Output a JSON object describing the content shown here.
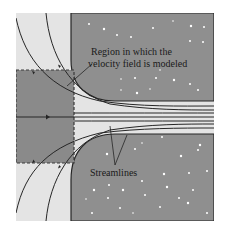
{
  "figure": {
    "labels": {
      "region": [
        "Region in which the",
        "velocity field is modeled"
      ],
      "streamlines": "Streamlines"
    },
    "colors": {
      "background": "#ffffff",
      "fluid": "#e4e4e4",
      "wall": "#8f8f8f",
      "region_fill": "#8a8a8a",
      "line": "#262626",
      "speckle": "#ffffff"
    }
  }
}
